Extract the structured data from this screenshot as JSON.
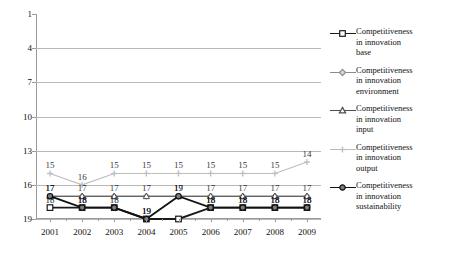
{
  "chart_data": {
    "type": "line",
    "title": "",
    "xlabel": "",
    "ylabel": "",
    "categories": [
      "2001",
      "2002",
      "2003",
      "2004",
      "2005",
      "2006",
      "2007",
      "2008",
      "2009"
    ],
    "x": [
      2001,
      2002,
      2003,
      2004,
      2005,
      2006,
      2007,
      2008,
      2009
    ],
    "ylim": [
      1,
      19
    ],
    "y_inverted": true,
    "y_ticks": [
      1,
      4,
      7,
      10,
      13,
      16,
      19
    ],
    "grid": "horizontal",
    "legend_position": "right",
    "series": [
      {
        "name": "Competitiveness in innovation base",
        "marker": "square",
        "color": "#1a1a1a",
        "values": [
          18,
          18,
          18,
          19,
          19,
          18,
          18,
          18,
          18
        ],
        "labels": [
          "18",
          "18",
          "18",
          "19",
          "",
          "18",
          "18",
          "18",
          "18"
        ]
      },
      {
        "name": "Competitiveness in innovation environment",
        "marker": "diamond",
        "color": "#8c8c8c",
        "values": [
          17,
          17,
          17,
          17,
          17,
          17,
          17,
          17,
          17
        ],
        "labels": [
          "17",
          "17",
          "17",
          "17",
          "17",
          "17",
          "17",
          "17",
          ""
        ]
      },
      {
        "name": "Competitiveness in innovation input",
        "marker": "triangle",
        "color": "#4d4d4d",
        "values": [
          17,
          17,
          17,
          17,
          17,
          17,
          17,
          17,
          17
        ],
        "labels": [
          "",
          "",
          "",
          "",
          "",
          "",
          "",
          "",
          "17"
        ]
      },
      {
        "name": "Competitiveness in innovation output",
        "marker": "line",
        "color": "#bdbdbd",
        "values": [
          15,
          16,
          15,
          15,
          15,
          15,
          15,
          15,
          14
        ],
        "labels": [
          "15",
          "16",
          "15",
          "15",
          "15",
          "15",
          "15",
          "15",
          "14"
        ]
      },
      {
        "name": "Competitiveness in innovation sustainability",
        "marker": "circle",
        "color": "#111111",
        "values": [
          17,
          18,
          18,
          19,
          17,
          18,
          18,
          18,
          18
        ],
        "labels": [
          "17",
          "18",
          "",
          "19",
          "19",
          "18",
          "18",
          "18",
          "18"
        ]
      }
    ]
  },
  "legend": {
    "items": [
      {
        "line1": "Competitiveness",
        "line2": "in innovation",
        "line3": "base"
      },
      {
        "line1": "Competitiveness",
        "line2": "in innovation",
        "line3": "environment"
      },
      {
        "line1": "Competitiveness",
        "line2": "in innovation",
        "line3": "input"
      },
      {
        "line1": "Competitiveness",
        "line2": "in innovation",
        "line3": "output"
      },
      {
        "line1": "Competitiveness",
        "line2": "in innovation",
        "line3": "sustainability"
      }
    ]
  }
}
